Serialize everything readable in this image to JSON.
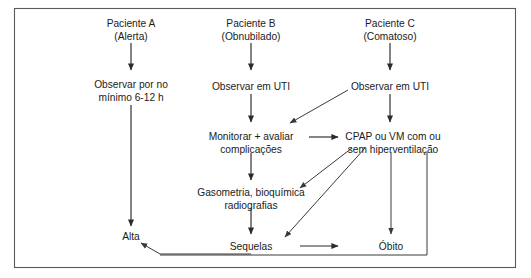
{
  "diagram": {
    "title_visible": false,
    "frame": {
      "x": 14,
      "y": 8,
      "width": 502,
      "height": 260,
      "border_color": "#5a5a5a"
    },
    "text_color": "#1b1b1b",
    "line_color": "#2b2b2b",
    "background": "#ffffff",
    "nodes": [
      {
        "id": "paciente-a",
        "lines": [
          "Paciente A",
          "(Alerta)"
        ],
        "x": 131,
        "y": 27,
        "column": "A"
      },
      {
        "id": "paciente-b",
        "lines": [
          "Paciente B",
          "(Obnubilado)"
        ],
        "x": 251,
        "y": 27,
        "column": "B"
      },
      {
        "id": "paciente-c",
        "lines": [
          "Paciente C",
          "(Comatoso)"
        ],
        "x": 390,
        "y": 27,
        "column": "C"
      },
      {
        "id": "observar-6-12h",
        "lines": [
          "Observar por no",
          "mínimo 6-12 h"
        ],
        "x": 131,
        "y": 85,
        "column": "A"
      },
      {
        "id": "observar-uti-b",
        "lines": [
          "Observar em UTI"
        ],
        "x": 251,
        "y": 85,
        "column": "B"
      },
      {
        "id": "observar-uti-c",
        "lines": [
          "Observar em UTI"
        ],
        "x": 390,
        "y": 85,
        "column": "C"
      },
      {
        "id": "monitorar-avaliar",
        "lines": [
          "Monitorar + avaliar",
          "complicações"
        ],
        "x": 251,
        "y": 137,
        "column": "B"
      },
      {
        "id": "cpap-vm",
        "lines": [
          "CPAP ou VM com ou",
          "sem hiperventilação"
        ],
        "x": 393,
        "y": 137,
        "column": "C"
      },
      {
        "id": "gasometria",
        "lines": [
          "Gasometria, bioquímica",
          "radiografias"
        ],
        "x": 251,
        "y": 194,
        "column": "B"
      },
      {
        "id": "alta",
        "lines": [
          "Alta"
        ],
        "x": 131,
        "y": 238,
        "column": "A"
      },
      {
        "id": "sequelas",
        "lines": [
          "Sequelas"
        ],
        "x": 251,
        "y": 246,
        "column": "B"
      },
      {
        "id": "obito",
        "lines": [
          "Óbito"
        ],
        "x": 391,
        "y": 246,
        "column": "C"
      }
    ],
    "edges": [
      {
        "id": "a-to-observar",
        "from": "paciente-a",
        "to": "observar-6-12h",
        "kind": "vertical-arrow"
      },
      {
        "id": "b-to-uti",
        "from": "paciente-b",
        "to": "observar-uti-b",
        "kind": "vertical-arrow"
      },
      {
        "id": "c-to-uti",
        "from": "paciente-c",
        "to": "observar-uti-c",
        "kind": "vertical-arrow"
      },
      {
        "id": "observar-to-alta",
        "from": "observar-6-12h",
        "to": "alta",
        "kind": "vertical-arrow-long"
      },
      {
        "id": "utib-to-monitorar",
        "from": "observar-uti-b",
        "to": "monitorar-avaliar",
        "kind": "vertical-arrow"
      },
      {
        "id": "utic-to-cpap",
        "from": "observar-uti-c",
        "to": "cpap-vm",
        "kind": "vertical-arrow"
      },
      {
        "id": "utic-to-monitorar",
        "from": "observar-uti-c",
        "to": "monitorar-avaliar",
        "kind": "diagonal-arrow"
      },
      {
        "id": "monitorar-to-cpap",
        "from": "monitorar-avaliar",
        "to": "cpap-vm",
        "kind": "horizontal-arrow"
      },
      {
        "id": "monitorar-to-gasometria",
        "from": "monitorar-avaliar",
        "to": "gasometria",
        "kind": "vertical-arrow"
      },
      {
        "id": "cpap-to-gasometria",
        "from": "cpap-vm",
        "to": "gasometria",
        "kind": "diagonal-arrow"
      },
      {
        "id": "cpap-to-sequelas",
        "from": "cpap-vm",
        "to": "sequelas",
        "kind": "diagonal-arrow"
      },
      {
        "id": "cpap-to-obito",
        "from": "cpap-vm",
        "to": "obito",
        "kind": "vertical-arrow-long"
      },
      {
        "id": "gasometria-to-sequelas",
        "from": "gasometria",
        "to": "sequelas",
        "kind": "vertical-arrow"
      },
      {
        "id": "sequelas-to-obito",
        "from": "sequelas",
        "to": "obito",
        "kind": "horizontal-arrow"
      },
      {
        "id": "sequelas-to-alta",
        "from": "sequelas",
        "to": "alta",
        "kind": "elbow-return-arrow"
      },
      {
        "id": "cpap-right-to-alta",
        "from": "cpap-vm",
        "to": "alta",
        "kind": "elbow-return-arrow-outer"
      }
    ]
  }
}
